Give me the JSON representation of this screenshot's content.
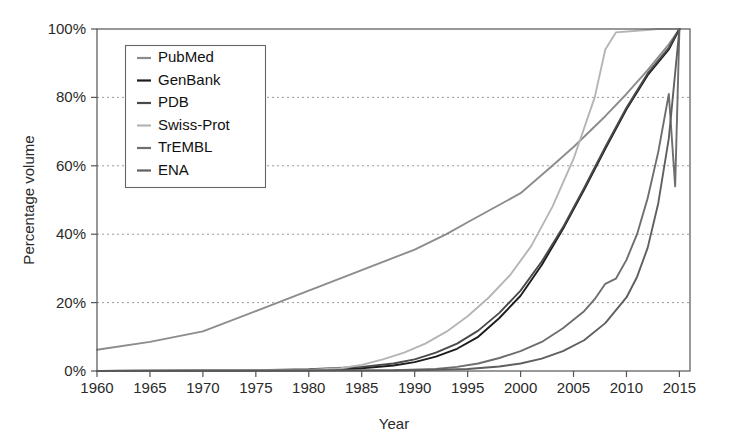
{
  "chart_data": {
    "type": "line",
    "title": "",
    "xlabel": "Year",
    "ylabel": "Percentage volume",
    "xlim": [
      1960,
      2016
    ],
    "ylim": [
      0,
      100
    ],
    "grid": true,
    "legend_position": "upper-left-inside",
    "xticks": [
      1960,
      1965,
      1970,
      1975,
      1980,
      1985,
      1990,
      1995,
      2000,
      2005,
      2010,
      2015
    ],
    "xtick_labels": [
      "1960",
      "1965",
      "1970",
      "1975",
      "1980",
      "1985",
      "1990",
      "1995",
      "2000",
      "2005",
      "2010",
      "2015"
    ],
    "yticks": [
      0,
      20,
      40,
      60,
      80,
      100
    ],
    "ytick_labels": [
      "0%",
      "20%",
      "40%",
      "60%",
      "80%",
      "100%"
    ],
    "x": [
      1960,
      1965,
      1970,
      1975,
      1980,
      1985,
      1990,
      1995,
      2000,
      2005,
      2010,
      2015
    ],
    "series": [
      {
        "name": "PubMed",
        "color": "#8c8c8c",
        "points": [
          [
            1960,
            6.2
          ],
          [
            1965,
            8.5
          ],
          [
            1970,
            11.6
          ],
          [
            1975,
            17.5
          ],
          [
            1980,
            23.5
          ],
          [
            1985,
            29.5
          ],
          [
            1990,
            35.5
          ],
          [
            1993,
            40.0
          ],
          [
            1995,
            43.5
          ],
          [
            2000,
            52.0
          ],
          [
            2003,
            60.0
          ],
          [
            2005,
            65.5
          ],
          [
            2008,
            74.5
          ],
          [
            2010,
            81.0
          ],
          [
            2012,
            88.0
          ],
          [
            2014,
            95.5
          ],
          [
            2015,
            100.0
          ]
        ]
      },
      {
        "name": "GenBank",
        "color": "#1c1c1c",
        "points": [
          [
            1960,
            0.0
          ],
          [
            1980,
            0.2
          ],
          [
            1983,
            0.4
          ],
          [
            1985,
            0.8
          ],
          [
            1988,
            1.6
          ],
          [
            1990,
            2.6
          ],
          [
            1992,
            4.2
          ],
          [
            1994,
            6.5
          ],
          [
            1996,
            10.0
          ],
          [
            1998,
            15.5
          ],
          [
            2000,
            22.0
          ],
          [
            2002,
            31.0
          ],
          [
            2004,
            41.5
          ],
          [
            2006,
            53.0
          ],
          [
            2008,
            65.0
          ],
          [
            2010,
            76.5
          ],
          [
            2012,
            86.5
          ],
          [
            2014,
            94.0
          ],
          [
            2015,
            100.0
          ]
        ]
      },
      {
        "name": "PDB",
        "color": "#4a4a4a",
        "points": [
          [
            1960,
            0.0
          ],
          [
            1975,
            0.2
          ],
          [
            1980,
            0.5
          ],
          [
            1985,
            1.2
          ],
          [
            1988,
            2.2
          ],
          [
            1990,
            3.4
          ],
          [
            1992,
            5.4
          ],
          [
            1994,
            8.0
          ],
          [
            1996,
            11.8
          ],
          [
            1998,
            17.0
          ],
          [
            2000,
            23.5
          ],
          [
            2002,
            32.0
          ],
          [
            2004,
            42.0
          ],
          [
            2006,
            53.5
          ],
          [
            2008,
            65.5
          ],
          [
            2010,
            77.0
          ],
          [
            2012,
            87.0
          ],
          [
            2014,
            94.5
          ],
          [
            2015,
            100.0
          ]
        ]
      },
      {
        "name": "Swiss-Prot",
        "color": "#b5b5b5",
        "points": [
          [
            1960,
            0.0
          ],
          [
            1980,
            0.3
          ],
          [
            1983,
            0.8
          ],
          [
            1985,
            1.8
          ],
          [
            1987,
            3.4
          ],
          [
            1989,
            5.4
          ],
          [
            1991,
            8.0
          ],
          [
            1993,
            11.5
          ],
          [
            1995,
            16.0
          ],
          [
            1997,
            21.5
          ],
          [
            1999,
            28.0
          ],
          [
            2001,
            36.5
          ],
          [
            2003,
            48.0
          ],
          [
            2005,
            62.0
          ],
          [
            2007,
            80.0
          ],
          [
            2008,
            94.0
          ],
          [
            2009,
            99.0
          ],
          [
            2011,
            99.5
          ],
          [
            2013,
            100.0
          ],
          [
            2015,
            100.0
          ]
        ]
      },
      {
        "name": "TrEMBL",
        "color": "#6e6e6e",
        "points": [
          [
            1960,
            0.0
          ],
          [
            1988,
            0.2
          ],
          [
            1992,
            0.6
          ],
          [
            1994,
            1.2
          ],
          [
            1996,
            2.2
          ],
          [
            1998,
            3.8
          ],
          [
            2000,
            5.8
          ],
          [
            2002,
            8.5
          ],
          [
            2004,
            12.5
          ],
          [
            2006,
            17.5
          ],
          [
            2007,
            21.0
          ],
          [
            2008,
            25.5
          ],
          [
            2009,
            27.0
          ],
          [
            2010,
            32.5
          ],
          [
            2011,
            40.0
          ],
          [
            2012,
            50.5
          ],
          [
            2013,
            64.0
          ],
          [
            2014,
            81.0
          ],
          [
            2014.6,
            54.0
          ],
          [
            2015,
            100.0
          ]
        ]
      },
      {
        "name": "ENA",
        "color": "#5f5f5f",
        "points": [
          [
            1960,
            0.0
          ],
          [
            1990,
            0.2
          ],
          [
            1995,
            0.6
          ],
          [
            1998,
            1.3
          ],
          [
            2000,
            2.2
          ],
          [
            2002,
            3.6
          ],
          [
            2004,
            5.8
          ],
          [
            2006,
            9.0
          ],
          [
            2008,
            14.0
          ],
          [
            2010,
            21.5
          ],
          [
            2011,
            27.5
          ],
          [
            2012,
            36.0
          ],
          [
            2013,
            49.0
          ],
          [
            2014,
            68.0
          ],
          [
            2014.5,
            84.0
          ],
          [
            2015,
            100.0
          ]
        ]
      }
    ]
  },
  "legend": {
    "items": [
      {
        "label": "PubMed"
      },
      {
        "label": "GenBank"
      },
      {
        "label": "PDB"
      },
      {
        "label": "Swiss-Prot"
      },
      {
        "label": "TrEMBL"
      },
      {
        "label": "ENA"
      }
    ]
  }
}
